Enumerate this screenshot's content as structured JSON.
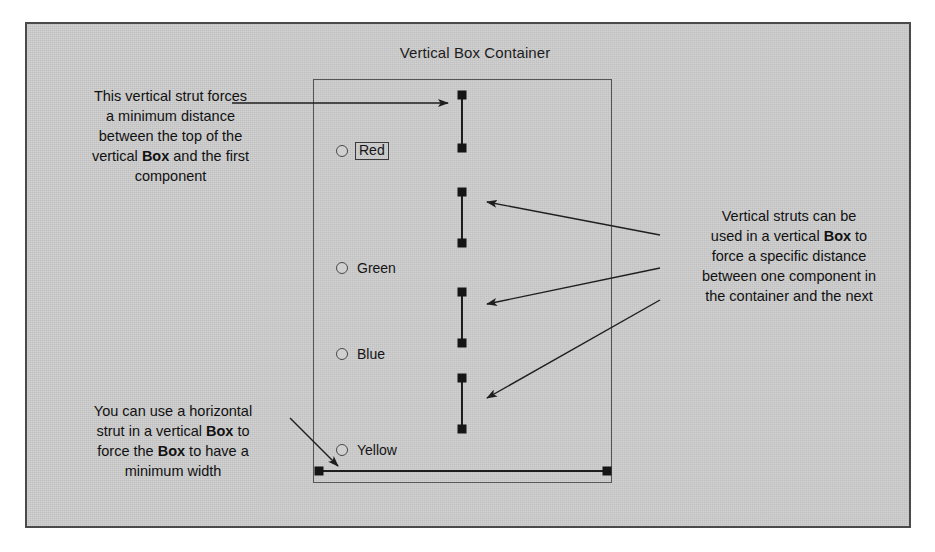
{
  "figure": {
    "container_title": "Vertical Box Container",
    "background_color": "#cdcdcd",
    "frame_border_color": "#4a4a4a",
    "ink_color": "#1c1c1c"
  },
  "box_container": {
    "radio_options": [
      {
        "label": "Red",
        "focused": true,
        "selected": false
      },
      {
        "label": "Green",
        "focused": false,
        "selected": false
      },
      {
        "label": "Blue",
        "focused": false,
        "selected": false
      },
      {
        "label": "Yellow",
        "focused": false,
        "selected": false
      }
    ]
  },
  "struts": {
    "vertical": [
      {
        "name": "top-strut"
      },
      {
        "name": "strut-after-red"
      },
      {
        "name": "strut-after-green"
      },
      {
        "name": "strut-after-blue"
      }
    ],
    "horizontal": [
      {
        "name": "bottom-horizontal-strut"
      }
    ]
  },
  "annotations": {
    "top_left": {
      "lines": [
        {
          "text": "This vertical strut forces"
        },
        {
          "text": "a minimum distance"
        },
        {
          "text": "between the top of the"
        },
        {
          "text": "vertical ",
          "bold": "Box",
          "tail": " and the first"
        },
        {
          "text": "component"
        }
      ],
      "plain": "This vertical strut forces a minimum distance between the top of the vertical Box and the first component"
    },
    "right": {
      "lines": [
        {
          "text": "Vertical struts can be"
        },
        {
          "text": "used in a vertical ",
          "bold": "Box",
          "tail": " to"
        },
        {
          "text": "force a specific distance"
        },
        {
          "text": "between one component in"
        },
        {
          "text": "the container and the next"
        }
      ],
      "plain": "Vertical struts can be used in a vertical Box to force a specific distance between one component in the container and the next"
    },
    "bottom_left": {
      "lines": [
        {
          "text": "You can use a horizontal"
        },
        {
          "text": "strut in a vertical ",
          "bold": "Box",
          "tail": " to"
        },
        {
          "text": "force the ",
          "bold": "Box",
          "tail": " to have a"
        },
        {
          "text": "minimum width"
        }
      ],
      "plain": "You can use a horizontal strut in a vertical Box to force the Box to have a minimum width"
    }
  }
}
